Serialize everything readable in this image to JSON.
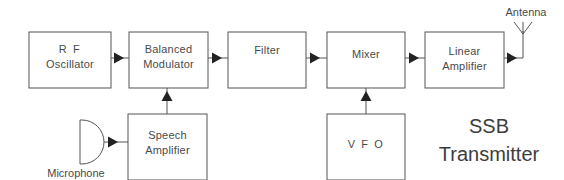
{
  "diagram": {
    "title_line1": "SSB",
    "title_line2": "Transmitter",
    "colors": {
      "background": "#ffffff",
      "box_stroke": "#555555",
      "wire": "#555555",
      "arrow": "#222222",
      "text": "#4a4a4a",
      "title_text": "#3d3d3d"
    },
    "blocks": [
      {
        "id": "rf-oscillator",
        "line1": "R F",
        "line2": "Oscillator"
      },
      {
        "id": "balanced-modulator",
        "line1": "Balanced",
        "line2": "Modulator"
      },
      {
        "id": "filter",
        "line1": "Filter",
        "line2": ""
      },
      {
        "id": "mixer",
        "line1": "Mixer",
        "line2": ""
      },
      {
        "id": "linear-amplifier",
        "line1": "Linear",
        "line2": "Amplifier"
      },
      {
        "id": "speech-amplifier",
        "line1": "Speech",
        "line2": "Amplifier"
      },
      {
        "id": "vfo",
        "line1": "V F O",
        "line2": ""
      }
    ],
    "components": [
      {
        "id": "microphone",
        "label": "Microphone",
        "symbol": "microphone-symbol"
      },
      {
        "id": "antenna",
        "label": "Antenna",
        "symbol": "antenna-symbol"
      }
    ]
  }
}
